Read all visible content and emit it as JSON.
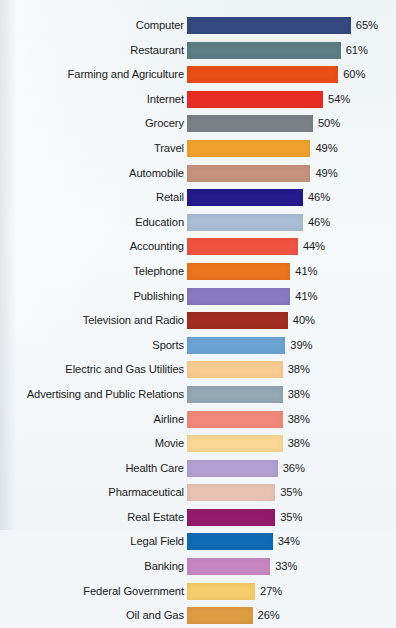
{
  "chart_data": {
    "type": "bar",
    "orientation": "horizontal",
    "title": "",
    "subtitle": "",
    "xlabel": "",
    "ylabel": "",
    "xlim": [
      0,
      70
    ],
    "grid": false,
    "legend": false,
    "value_suffix": "%",
    "categories": [
      "Computer",
      "Restaurant",
      "Farming and Agriculture",
      "Internet",
      "Grocery",
      "Travel",
      "Automobile",
      "Retail",
      "Education",
      "Accounting",
      "Telephone",
      "Publishing",
      "Television and Radio",
      "Sports",
      "Electric and Gas Utilities",
      "Advertising and Public Relations",
      "Airline",
      "Movie",
      "Health Care",
      "Pharmaceutical",
      "Real Estate",
      "Legal Field",
      "Banking",
      "Federal Government",
      "Oil and Gas"
    ],
    "values": [
      65,
      61,
      60,
      54,
      50,
      49,
      49,
      46,
      46,
      44,
      41,
      41,
      40,
      39,
      38,
      38,
      38,
      38,
      36,
      35,
      35,
      34,
      33,
      27,
      26
    ],
    "value_labels": [
      "65%",
      "61%",
      "60%",
      "54%",
      "50%",
      "49%",
      "49%",
      "46%",
      "46%",
      "44%",
      "41%",
      "41%",
      "40%",
      "39%",
      "38%",
      "38%",
      "38%",
      "38%",
      "36%",
      "35%",
      "35%",
      "34%",
      "33%",
      "27%",
      "26%"
    ],
    "colors": [
      "#34497f",
      "#5c7e84",
      "#ea4f14",
      "#e92d24",
      "#7c8087",
      "#f0a22c",
      "#c8937c",
      "#261a8c",
      "#a9bdd4",
      "#ef5442",
      "#e9751e",
      "#8878c0",
      "#a02d20",
      "#6ba4d4",
      "#fbcb91",
      "#93a7b4",
      "#f1897a",
      "#f8d894",
      "#b2a0d2",
      "#e8c3b1",
      "#941b6b",
      "#0f6ab4",
      "#c788c1",
      "#f7cc6a",
      "#dd9b42"
    ],
    "bar_count": 25,
    "max_value": 65,
    "min_value": 26
  },
  "style": {
    "background_color": "#f2f6f8",
    "text_color": "#1b1b1b",
    "bar_origin_px": 187,
    "px_per_unit": 2.52
  }
}
